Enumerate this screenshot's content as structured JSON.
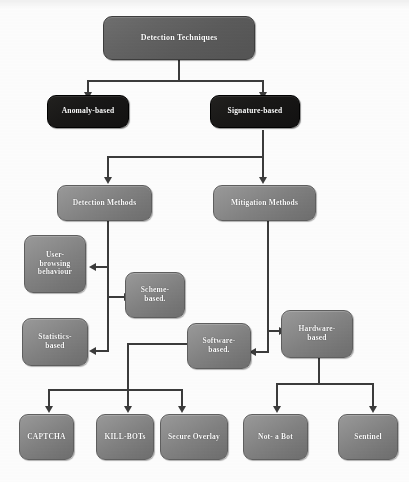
{
  "diagram": {
    "colors": {
      "node_grey": "#808080",
      "node_grey_dark": "#5b5b5b",
      "node_black": "#191817",
      "connector": "#3b3b3b",
      "background": "#fdfdfd",
      "label_text": "#ffffff"
    },
    "nodes": [
      {
        "id": "root",
        "label": "Detection Techniques",
        "style": "grey-dark",
        "level": 0
      },
      {
        "id": "anomaly",
        "label": "Anomaly-based",
        "style": "black",
        "level": 1
      },
      {
        "id": "signature",
        "label": "Signature-based",
        "style": "black",
        "level": 1
      },
      {
        "id": "detection",
        "label": "Detection Methods",
        "style": "grey",
        "level": 2
      },
      {
        "id": "mitigation",
        "label": "Mitigation Methods",
        "style": "grey",
        "level": 2
      },
      {
        "id": "userbrowse",
        "label": "User-\nbrowsing\nbehaviour",
        "line1": "User-",
        "line2": "browsing",
        "line3": "behaviour",
        "style": "grey",
        "level": 3
      },
      {
        "id": "scheme",
        "label": "Scheme-based",
        "line1": "Scheme-",
        "line2": "based.",
        "style": "grey",
        "level": 3
      },
      {
        "id": "statistics",
        "label": "Statistics-based",
        "line1": "Statistics-",
        "line2": "based",
        "style": "grey",
        "level": 3
      },
      {
        "id": "software",
        "label": "Software-based",
        "line1": "Software-",
        "line2": "based.",
        "style": "grey",
        "level": 3
      },
      {
        "id": "hardware",
        "label": "Hardware-based",
        "line1": "Hardware-",
        "line2": "based",
        "style": "grey",
        "level": 3
      },
      {
        "id": "captcha",
        "label": "CAPTCHA",
        "style": "grey",
        "level": 4
      },
      {
        "id": "killbots",
        "label": "KILL-BOTs",
        "style": "grey",
        "level": 4
      },
      {
        "id": "overlay",
        "label": "Secure Overlay",
        "style": "grey",
        "level": 4
      },
      {
        "id": "notabot",
        "label": "Not- a Bot",
        "style": "grey",
        "level": 4
      },
      {
        "id": "sentinel",
        "label": "Sentinel",
        "style": "grey",
        "level": 4
      }
    ],
    "edges": [
      {
        "from": "root",
        "to": "anomaly"
      },
      {
        "from": "root",
        "to": "signature"
      },
      {
        "from": "signature",
        "to": "detection"
      },
      {
        "from": "signature",
        "to": "mitigation"
      },
      {
        "from": "detection",
        "to": "userbrowse"
      },
      {
        "from": "detection",
        "to": "scheme"
      },
      {
        "from": "detection",
        "to": "statistics"
      },
      {
        "from": "mitigation",
        "to": "hardware"
      },
      {
        "from": "mitigation",
        "to": "software"
      },
      {
        "from": "software",
        "to": "captcha"
      },
      {
        "from": "software",
        "to": "killbots"
      },
      {
        "from": "software",
        "to": "overlay"
      },
      {
        "from": "hardware",
        "to": "notabot"
      },
      {
        "from": "hardware",
        "to": "sentinel"
      }
    ]
  }
}
